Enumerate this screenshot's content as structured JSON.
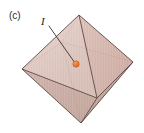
{
  "figure": {
    "panel_label": "(c)",
    "site_label": "I",
    "caption_alt": "Octahedron with interstitial site I"
  },
  "colors": {
    "face_light": "#e0cac3",
    "face_upper_left": "#d9c0b8",
    "face_upper_right": "#cfa99f",
    "face_lower_left": "#c2a298",
    "face_lower_right": "#b99d94",
    "face_front": "#caa69c",
    "edge": "#5d4b46",
    "edge_hidden": "#8a7068",
    "marker": "#e8762c",
    "marker_stroke": "#b4561c",
    "leader_line": "#3a3330",
    "label_text": "#2b2b2b",
    "background": "#ffffff"
  },
  "geometry": {
    "vertices": {
      "top": {
        "x": 79,
        "y": 15
      },
      "left": {
        "x": 22,
        "y": 69
      },
      "right": {
        "x": 133,
        "y": 62
      },
      "bottom": {
        "x": 81,
        "y": 123
      },
      "front": {
        "x": 97,
        "y": 98
      },
      "back": {
        "x": 62,
        "y": 42
      }
    },
    "marker": {
      "x": 76,
      "y": 64,
      "r": 3.2
    },
    "leader": {
      "x1": 49,
      "y1": 26,
      "x2": 74.4,
      "y2": 62.2
    },
    "panel_label_pos": {
      "x": 9,
      "y": 19
    },
    "site_label_pos": {
      "x": 41,
      "y": 25
    }
  }
}
